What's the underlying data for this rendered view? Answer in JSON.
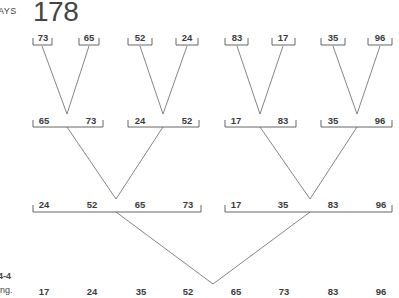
{
  "header": {
    "running_head": "AYS",
    "page_number": "178"
  },
  "caption": {
    "figure_number": "4-4",
    "text": "ing."
  },
  "diagram": {
    "type": "merge-sort-tree",
    "level0": [
      {
        "values": [
          "73"
        ]
      },
      {
        "values": [
          "65"
        ]
      },
      {
        "values": [
          "52"
        ]
      },
      {
        "values": [
          "24"
        ]
      },
      {
        "values": [
          "83"
        ]
      },
      {
        "values": [
          "17"
        ]
      },
      {
        "values": [
          "35"
        ]
      },
      {
        "values": [
          "96"
        ]
      }
    ],
    "level1": [
      {
        "values": [
          "65",
          "73"
        ]
      },
      {
        "values": [
          "24",
          "52"
        ]
      },
      {
        "values": [
          "17",
          "83"
        ]
      },
      {
        "values": [
          "35",
          "96"
        ]
      }
    ],
    "level2": [
      {
        "values": [
          "24",
          "52",
          "65",
          "73"
        ]
      },
      {
        "values": [
          "17",
          "35",
          "83",
          "96"
        ]
      }
    ],
    "level3": [
      {
        "values": [
          "17",
          "24",
          "35",
          "52",
          "65",
          "73",
          "83",
          "96"
        ]
      }
    ]
  }
}
